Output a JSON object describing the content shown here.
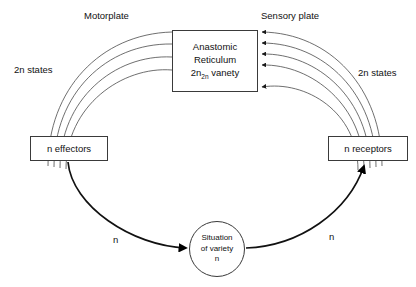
{
  "diagram": {
    "background_color": "#ffffff",
    "stroke_color": "#3a3a3a",
    "text_color": "#111111"
  },
  "nodes": {
    "reticulum": {
      "line1": "Anastomic",
      "line2": "Reticulum",
      "line3_prefix": "2n",
      "line3_subscript": "2n",
      "line3_suffix": " vanety"
    },
    "effectors": {
      "label": "n effectors"
    },
    "receptors": {
      "label": "n receptors"
    },
    "variety_circle": {
      "line1": "Situation",
      "line2": "of variety",
      "line3": "n"
    }
  },
  "labels": {
    "motorplate": "Motorplate",
    "sensory_plate": "Sensory plate",
    "left_states": "2n states",
    "right_states": "2n states",
    "n_left": "n",
    "n_right": "n"
  },
  "edges": {
    "motor_bundle_count": 4,
    "sensory_bundle_count": 5,
    "feedback_left": "effectors to situation of variety",
    "feedback_right": "situation of variety to receptors"
  }
}
